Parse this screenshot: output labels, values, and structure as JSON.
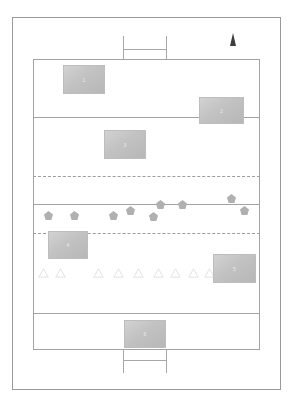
{
  "diagram": {
    "type": "field-plan",
    "page_background": "#ffffff",
    "outer_frame": {
      "x": 12,
      "y": 17,
      "width": 269,
      "height": 373,
      "stroke": "#9a9a9a"
    },
    "pitch": {
      "x": 33,
      "y": 59,
      "width": 227,
      "height": 291,
      "stroke": "#a3a3a3",
      "fill": "#ffffff"
    },
    "north_arrow": {
      "name": "north-arrow",
      "x": 230,
      "y": 33,
      "color": "#3d3d3d"
    },
    "solid_lines": [
      {
        "name": "quarter-line-top",
        "y": 117,
        "stroke": "#a3a3a3"
      },
      {
        "name": "centre-line",
        "y": 204,
        "stroke": "#a3a3a3"
      },
      {
        "name": "quarter-line-bottom",
        "y": 313,
        "stroke": "#a3a3a3"
      }
    ],
    "dashed_lines": [
      {
        "name": "dashed-line-upper",
        "y": 176,
        "stroke": "#9d9d9d"
      },
      {
        "name": "dashed-line-lower",
        "y": 233,
        "stroke": "#9d9d9d"
      }
    ],
    "goals": [
      {
        "name": "goal-top",
        "x": 123,
        "y": 36,
        "width": 44,
        "height": 23,
        "crossbar_offset": 13
      },
      {
        "name": "goal-bottom",
        "x": 123,
        "y": 350,
        "width": 44,
        "height": 23,
        "crossbar_offset": 10
      }
    ],
    "blocks": [
      {
        "name": "block-1",
        "label": "1",
        "x": 63,
        "y": 65,
        "width": 42,
        "height": 29
      },
      {
        "name": "block-2",
        "label": "2",
        "x": 199,
        "y": 97,
        "width": 45,
        "height": 27
      },
      {
        "name": "block-3",
        "label": "3",
        "x": 104,
        "y": 130,
        "width": 42,
        "height": 29
      },
      {
        "name": "block-4",
        "label": "4",
        "x": 48,
        "y": 231,
        "width": 40,
        "height": 28
      },
      {
        "name": "block-5",
        "label": "5",
        "x": 213,
        "y": 254,
        "width": 43,
        "height": 29
      },
      {
        "name": "block-6",
        "label": "6",
        "x": 124,
        "y": 320,
        "width": 42,
        "height": 28
      }
    ],
    "pentagon_markers": {
      "fill": "#b0b0b0",
      "count": 10,
      "points": [
        {
          "x": 44,
          "y": 211
        },
        {
          "x": 70,
          "y": 211
        },
        {
          "x": 109,
          "y": 211
        },
        {
          "x": 126,
          "y": 206
        },
        {
          "x": 149,
          "y": 212
        },
        {
          "x": 156,
          "y": 200
        },
        {
          "x": 178,
          "y": 200
        },
        {
          "x": 227,
          "y": 194
        },
        {
          "x": 240,
          "y": 206
        }
      ]
    },
    "triangle_markers": {
      "stroke": "#e2e2e2",
      "count": 10,
      "points": [
        {
          "x": 38,
          "y": 268
        },
        {
          "x": 55,
          "y": 268
        },
        {
          "x": 93,
          "y": 268
        },
        {
          "x": 113,
          "y": 268
        },
        {
          "x": 133,
          "y": 268
        },
        {
          "x": 153,
          "y": 268
        },
        {
          "x": 170,
          "y": 268
        },
        {
          "x": 188,
          "y": 268
        },
        {
          "x": 204,
          "y": 268
        },
        {
          "x": 221,
          "y": 268
        }
      ]
    }
  }
}
